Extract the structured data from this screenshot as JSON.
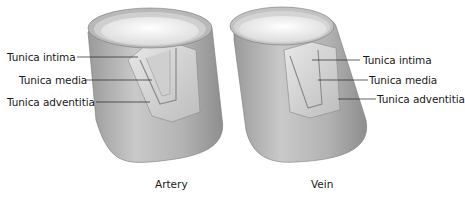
{
  "figure": {
    "panels": [
      {
        "id": "artery",
        "caption": "Artery",
        "labels": [
          "Tunica intima",
          "Tunica media",
          "Tunica adventitia"
        ]
      },
      {
        "id": "vein",
        "caption": "Vein",
        "labels": [
          "Tunica intima",
          "Tunica media",
          "Tunica adventitia"
        ]
      }
    ],
    "colors": {
      "outer_wall": "#a8a8a8",
      "wall_highlight": "#d6d6d6",
      "lumen": "#f2f2f2",
      "leader_line": "#222222"
    }
  }
}
